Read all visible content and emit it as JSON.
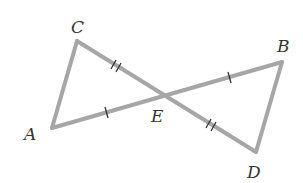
{
  "diagram": {
    "type": "geometry",
    "colors": {
      "segment": "#a6a6a6",
      "tick": "#333333",
      "label": "#333333"
    },
    "points": {
      "A": {
        "label": "A",
        "x": 52,
        "y": 128
      },
      "B": {
        "label": "B",
        "x": 282,
        "y": 62
      },
      "C": {
        "label": "C",
        "x": 77,
        "y": 41
      },
      "D": {
        "label": "D",
        "x": 256,
        "y": 152
      },
      "E": {
        "label": "E",
        "x": 166,
        "y": 95
      }
    },
    "segments": [
      {
        "from": "A",
        "to": "C"
      },
      {
        "from": "C",
        "to": "D",
        "through": "E"
      },
      {
        "from": "A",
        "to": "B",
        "through": "E"
      },
      {
        "from": "B",
        "to": "D"
      }
    ],
    "congruence_marks": [
      {
        "segment": "CE",
        "ticks": 2
      },
      {
        "segment": "ED",
        "ticks": 2
      },
      {
        "segment": "AE",
        "ticks": 1
      },
      {
        "segment": "EB",
        "ticks": 1
      }
    ]
  }
}
